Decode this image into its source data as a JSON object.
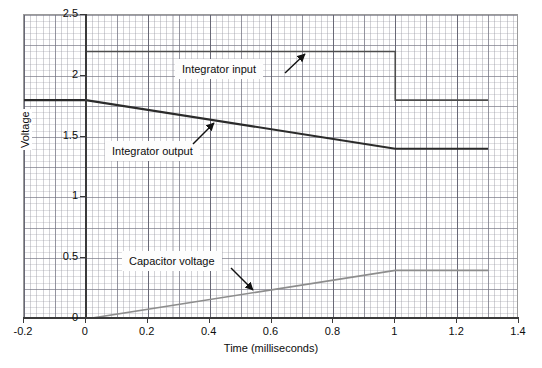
{
  "chart_data": {
    "type": "line",
    "title": "",
    "xlabel": "Time (milliseconds)",
    "ylabel": "Voltage",
    "xlim": [
      -0.2,
      1.4
    ],
    "ylim": [
      0,
      2.5
    ],
    "xticks": [
      "-0.2",
      "0",
      "0.2",
      "0.4",
      "0.6",
      "0.8",
      "1",
      "1.2",
      "1.4"
    ],
    "xtick_values": [
      -0.2,
      0,
      0.2,
      0.4,
      0.6,
      0.8,
      1.0,
      1.2,
      1.4
    ],
    "yticks": [
      "0",
      "0.5",
      "1",
      "1.5",
      "2",
      "2.5"
    ],
    "ytick_values": [
      0,
      0.5,
      1.0,
      1.5,
      2.0,
      2.5
    ],
    "grid": true,
    "grid_style": "graph-paper minor and major gridlines",
    "legend": "inline annotated callout boxes with arrows",
    "series": [
      {
        "name": "Integrator input",
        "color": "#4d4d4d",
        "width": 1.6,
        "points": [
          [
            -0.2,
            1.8
          ],
          [
            0.0,
            1.8
          ],
          [
            0.0,
            2.2
          ],
          [
            1.0,
            2.2
          ],
          [
            1.0,
            1.8
          ],
          [
            1.3,
            1.8
          ]
        ]
      },
      {
        "name": "Integrator output",
        "color": "#2b2b2b",
        "width": 2.1,
        "points": [
          [
            -0.2,
            1.8
          ],
          [
            0.0,
            1.8
          ],
          [
            1.0,
            1.4
          ],
          [
            1.3,
            1.4
          ]
        ]
      },
      {
        "name": "Capacitor voltage",
        "color": "#8d8d8d",
        "width": 1.6,
        "points": [
          [
            -0.2,
            0.0
          ],
          [
            0.0,
            0.0
          ],
          [
            1.0,
            0.4
          ],
          [
            1.3,
            0.4
          ]
        ]
      }
    ],
    "annotations": [
      {
        "label": "Integrator input",
        "arrow_to": [
          0.78,
          2.2
        ]
      },
      {
        "label": "Integrator output",
        "arrow_to": [
          0.42,
          1.62
        ]
      },
      {
        "label": "Capacitor voltage",
        "arrow_to": [
          0.56,
          0.22
        ]
      }
    ]
  },
  "axes": {
    "x_title": "Time (milliseconds)",
    "y_title": "Voltage",
    "x_tick_labels": [
      "-0.2",
      "0",
      "0.2",
      "0.4",
      "0.6",
      "0.8",
      "1",
      "1.2",
      "1.4"
    ],
    "y_tick_labels": [
      "0",
      "0.5",
      "1",
      "1.5",
      "2",
      "2.5"
    ]
  },
  "callouts": {
    "integrator_input": "Integrator input",
    "integrator_output": "Integrator output",
    "capacitor_voltage": "Capacitor voltage"
  },
  "colors": {
    "integrator_input": "#4d4d4d",
    "integrator_output": "#2b2b2b",
    "capacitor_voltage": "#8d8d8d",
    "axis": "#3a3a3a",
    "grid_minor": "#9696a0",
    "grid_major": "#6e6e7d",
    "background": "#ffffff"
  }
}
